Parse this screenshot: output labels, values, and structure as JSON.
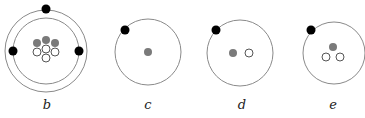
{
  "figure": {
    "panels": [
      {
        "id": "b",
        "label": "b",
        "center": [
          46,
          51
        ],
        "orbits": [
          41,
          33
        ],
        "electrons": [
          [
            46,
            9
          ],
          [
            13,
            51
          ],
          [
            79,
            51
          ]
        ],
        "protons": [
          [
            37,
            43
          ],
          [
            46,
            40
          ],
          [
            55,
            43
          ]
        ],
        "neutrons": [
          [
            37,
            52
          ],
          [
            46,
            49
          ],
          [
            55,
            52
          ],
          [
            46,
            58
          ]
        ]
      },
      {
        "id": "c",
        "label": "c",
        "center": [
          148,
          52
        ],
        "orbits": [
          33
        ],
        "electrons": [
          [
            125,
            30
          ]
        ],
        "protons": [
          [
            148,
            52
          ]
        ],
        "neutrons": []
      },
      {
        "id": "d",
        "label": "d",
        "center": [
          240,
          53
        ],
        "orbits": [
          33
        ],
        "electrons": [
          [
            216,
            30
          ]
        ],
        "protons": [
          [
            233,
            53
          ]
        ],
        "neutrons": [
          [
            249,
            53
          ]
        ]
      },
      {
        "id": "e",
        "label": "e",
        "center": [
          334,
          53
        ],
        "orbits": [
          31
        ],
        "electrons": [
          [
            311,
            30
          ]
        ],
        "protons": [
          [
            333,
            47
          ]
        ],
        "neutrons": [
          [
            326,
            57
          ],
          [
            340,
            57
          ]
        ]
      }
    ],
    "colors": {
      "electron": "#000000",
      "proton": "#7a7a7a",
      "neutron_stroke": "#555555",
      "orbit": "#8a8a8a"
    },
    "radii": {
      "electron": 4.5,
      "nucleon": 4
    }
  }
}
